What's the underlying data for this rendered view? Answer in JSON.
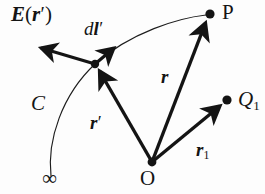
{
  "figure": {
    "type": "physics-vector-diagram",
    "background_color": "#fdfdfd",
    "ink_color": "#141414",
    "width": 265,
    "height": 194,
    "labels": {
      "field_vector": {
        "head": "E",
        "open_paren": "(",
        "arg": "r",
        "prime": "′",
        "close_paren": ")"
      },
      "line_element": {
        "d": "d",
        "vector": "l",
        "prime": "′"
      },
      "point_p": "P",
      "point_o": "O",
      "point_q1": {
        "letter": "Q",
        "sub": "1"
      },
      "curve": "C",
      "infinity": "∞",
      "r_vector": "r",
      "r_prime_vector": {
        "letter": "r",
        "prime": "′"
      },
      "r1_vector": {
        "letter": "r",
        "sub": "1"
      }
    },
    "points": [
      {
        "name": "P",
        "x": 210,
        "y": 15,
        "marker": "filled-dot"
      },
      {
        "name": "Q1",
        "x": 227,
        "y": 100,
        "marker": "filled-dot"
      },
      {
        "name": "O",
        "x": 152,
        "y": 162,
        "marker": "filled-dot"
      },
      {
        "name": "source-point",
        "x": 95,
        "y": 64,
        "marker": "filled-dot"
      }
    ],
    "vectors": [
      {
        "name": "E(r')",
        "from": [
          95,
          64
        ],
        "to": [
          33,
          45
        ],
        "style": "bold-arrow"
      },
      {
        "name": "dl'",
        "from": [
          95,
          64
        ],
        "to": [
          120,
          42
        ],
        "style": "bold-arrow"
      },
      {
        "name": "r'",
        "from": [
          152,
          162
        ],
        "to": [
          95,
          64
        ],
        "style": "bold-arrow"
      },
      {
        "name": "r",
        "from": [
          152,
          162
        ],
        "to": [
          208,
          18
        ],
        "style": "bold-arrow"
      },
      {
        "name": "r1",
        "from": [
          152,
          162
        ],
        "to": [
          224,
          103
        ],
        "style": "bold-arrow"
      }
    ],
    "curve": {
      "name": "C",
      "style": "thin-line",
      "description": "path from infinity through the source point to P",
      "d": "M 51,176 C 48,140 62,94 95,64 C 130,33 178,19 206,16"
    }
  }
}
